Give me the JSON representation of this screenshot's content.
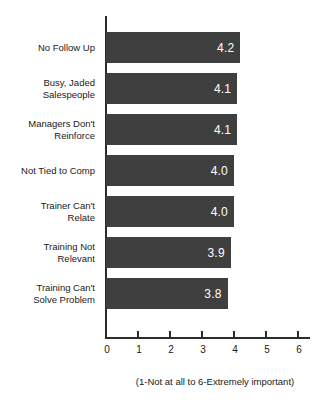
{
  "chart_data": {
    "type": "bar",
    "orientation": "horizontal",
    "title": "",
    "subtitle": "",
    "xlabel": "(1-Not at all to 6-Extremely important)",
    "ylabel": "",
    "categories": [
      "No Follow Up",
      "Busy, Jaded\nSalespeople",
      "Managers Don't\nReinforce",
      "Not Tied to Comp",
      "Trainer Can't\nRelate",
      "Training Not\nRelevant",
      "Training Can't\nSolve Problem"
    ],
    "values": [
      4.2,
      4.1,
      4.1,
      4.0,
      4.0,
      3.9,
      3.8
    ],
    "value_labels": [
      "4.2",
      "4.1",
      "4.1",
      "4.0",
      "4.0",
      "3.9",
      "3.8"
    ],
    "xlim": [
      0,
      6
    ],
    "xticks": [
      0,
      1,
      2,
      3,
      4,
      5,
      6
    ],
    "xtick_labels": [
      "0",
      "1",
      "2",
      "3",
      "4",
      "5",
      "6"
    ],
    "grid": false,
    "legend": false,
    "bar_color": "#3f3f3f",
    "value_label_color": "#ffffff",
    "axis_color": "#2b2b2b",
    "background_color": "#ffffff"
  }
}
